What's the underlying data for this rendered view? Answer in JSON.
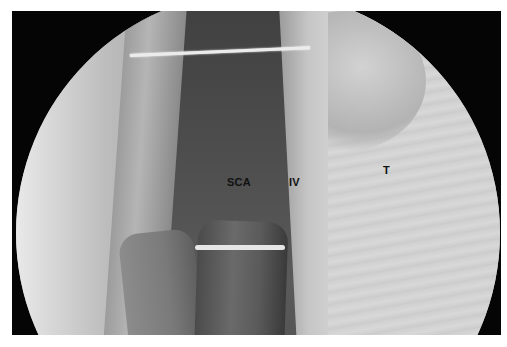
{
  "image": {
    "description": "Endoscopic grayscale anatomical view within circular scope field",
    "labels": {
      "sca": "SCA",
      "iv": "IV",
      "t": "T"
    }
  }
}
